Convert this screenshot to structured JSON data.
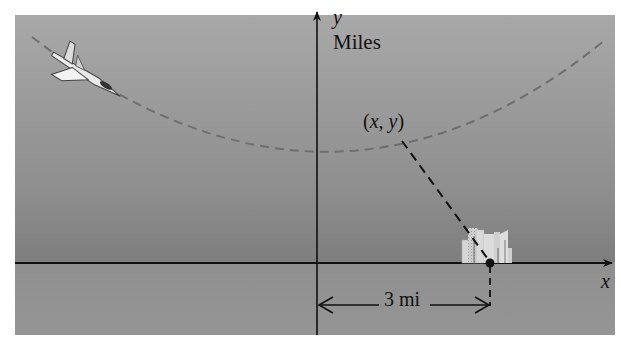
{
  "figure": {
    "axis_labels": {
      "x": "x",
      "y": "y"
    },
    "units_label": "Miles",
    "point_label": {
      "open": "(",
      "x": "x",
      "sep": ", ",
      "y": "y",
      "close": ")"
    },
    "distance_label": "3 mi",
    "elements": {
      "airplane": "jet-plane-icon",
      "city": "city-buildings-icon",
      "flight_path": "dashed-parabola",
      "line_of_sight": "dashed-line from (x, y) to city point",
      "city_point": "filled-dot on x-axis"
    },
    "colors": {
      "background_top": "#a8a8a8",
      "background_horizon": "#7e7e7e",
      "ground": "#959595",
      "axis": "#111111",
      "flight_path": "#6e6e6e",
      "buildings": "#d8d8d8"
    }
  }
}
